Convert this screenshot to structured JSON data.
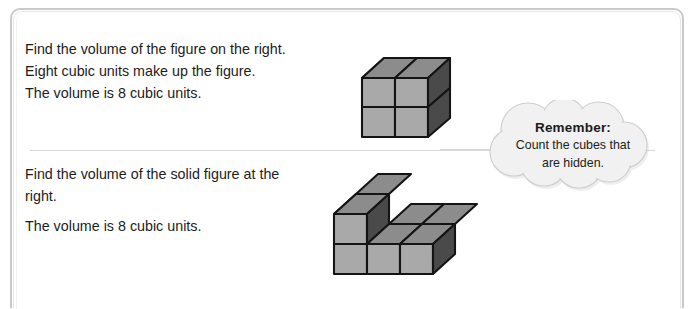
{
  "page": {
    "background_color": "#ffffff",
    "frame_color": "#c9c9c9",
    "divider_color": "#d8d8d8"
  },
  "exercise_top": {
    "lines": [
      "Find the volume of the figure on the right.",
      "Eight cubic units make up the figure.",
      "The volume is 8 cubic units."
    ]
  },
  "exercise_bottom": {
    "lines": [
      "Find the volume of the solid figure at the right.",
      "The volume is 8 cubic units."
    ]
  },
  "callout": {
    "title": "Remember:",
    "body_line_1": "Count the cubes that",
    "body_line_2": "are hidden.",
    "fill_color": "#f1f1f1",
    "stroke_color": "#cccccc"
  },
  "figures": {
    "cube_colors": {
      "top_face": "#8c8c8c",
      "front_face": "#a9a9a9",
      "side_face": "#4a4a4a",
      "outline": "#141414"
    },
    "cube_2x2x2": {
      "name": "2 by 2 by 2 cube stack",
      "visible_cubes": 8,
      "dimensions": {
        "width": 2,
        "depth": 2,
        "height": 2
      }
    },
    "solid_l": {
      "name": "L shaped solid figure",
      "visible_cubes": 8,
      "base_layer": {
        "width": 3,
        "depth": 2
      },
      "stacked_cubes": 2
    }
  }
}
